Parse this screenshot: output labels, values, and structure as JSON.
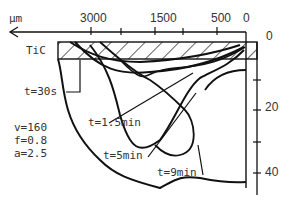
{
  "diagram": {
    "type": "wear-profile-diagram",
    "top_axis": {
      "unit_label": "μm",
      "direction": "leftward-arrow",
      "tick_labels": [
        "3000",
        "1500",
        "500",
        "0"
      ]
    },
    "right_axis": {
      "tick_labels": [
        "0",
        "20",
        "40"
      ]
    },
    "band_label": "TiC",
    "curves": [
      {
        "label": "t=30s"
      },
      {
        "label": "t=1.5min"
      },
      {
        "label": "t=5min"
      },
      {
        "label": "t=9min"
      }
    ],
    "parameters": [
      {
        "text": "v=160"
      },
      {
        "text": "f=0.8"
      },
      {
        "text": "a=2.5"
      }
    ],
    "colors": {
      "ink": "#111111",
      "text": "#333333",
      "background": "#ffffff"
    }
  }
}
